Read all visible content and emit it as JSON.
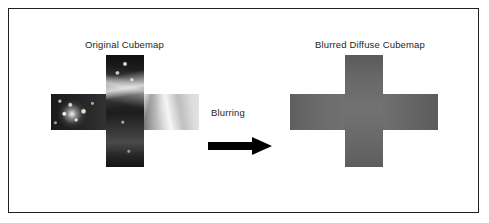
{
  "figure": {
    "border_color": "#231f20",
    "background": "#ffffff",
    "left_caption": "Original Cubemap",
    "right_caption": "Blurred Diffuse Cubemap",
    "arrow_label": "Blurring"
  },
  "cubemaps": [
    {
      "name": "original-cubemap",
      "caption": "Original Cubemap",
      "appearance": "photographic high-contrast HDR environment map laid out as a cross",
      "dominant_colors": [
        "#1a1a1a",
        "#8d8d8d",
        "#e2e2e2"
      ]
    },
    {
      "name": "blurred-diffuse-cubemap",
      "caption": "Blurred Diffuse Cubemap",
      "appearance": "uniform mid-gray blurred irradiance map laid out as a cross",
      "dominant_colors": [
        "#5f5f5f",
        "#6f6f6f",
        "#737373"
      ]
    }
  ],
  "arrow": {
    "label": "Blurring",
    "direction": "right",
    "color": "#000000"
  }
}
